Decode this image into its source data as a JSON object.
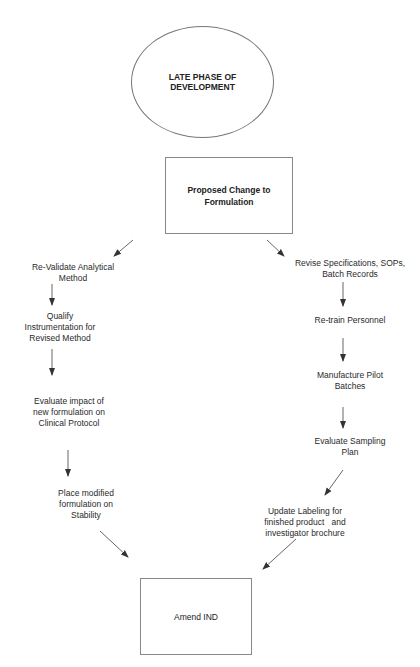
{
  "diagram": {
    "start": {
      "label": "LATE PHASE OF DEVELOPMENT",
      "line1": "LATE PHASE OF",
      "line2": "DEVELOPMENT",
      "shape": "ellipse"
    },
    "decision": {
      "label": "Proposed Change to Formulation",
      "line1": "Proposed Change to",
      "line2": "Formulation",
      "shape": "rectangle"
    },
    "left_branch": [
      {
        "line1": "Re-Validate Analytical",
        "line2": "Method",
        "line3": ""
      },
      {
        "line1": "Qualify",
        "line2": "Instrumentation for",
        "line3": "Revised Method"
      },
      {
        "line1": "Evaluate impact of",
        "line2": "new formulation on",
        "line3": "Clinical Protocol"
      },
      {
        "line1": "Place modified",
        "line2": "formulation on",
        "line3": "Stability"
      }
    ],
    "right_branch": [
      {
        "line1": "Revise Specifications, SOPs,",
        "line2": "Batch Records",
        "line3": ""
      },
      {
        "line1": "Re-train Personnel",
        "line2": "",
        "line3": ""
      },
      {
        "line1": "Manufacture Pilot",
        "line2": "Batches",
        "line3": ""
      },
      {
        "line1": "Evaluate Sampling",
        "line2": "Plan",
        "line3": ""
      },
      {
        "line1": "Update Labeling for",
        "line2": "finished product   and",
        "line3": "investigator brochure"
      }
    ],
    "end": {
      "label": "Amend IND",
      "shape": "rectangle"
    },
    "colors": {
      "line": "#555555",
      "text": "#2a2a2a",
      "background": "#ffffff"
    }
  }
}
